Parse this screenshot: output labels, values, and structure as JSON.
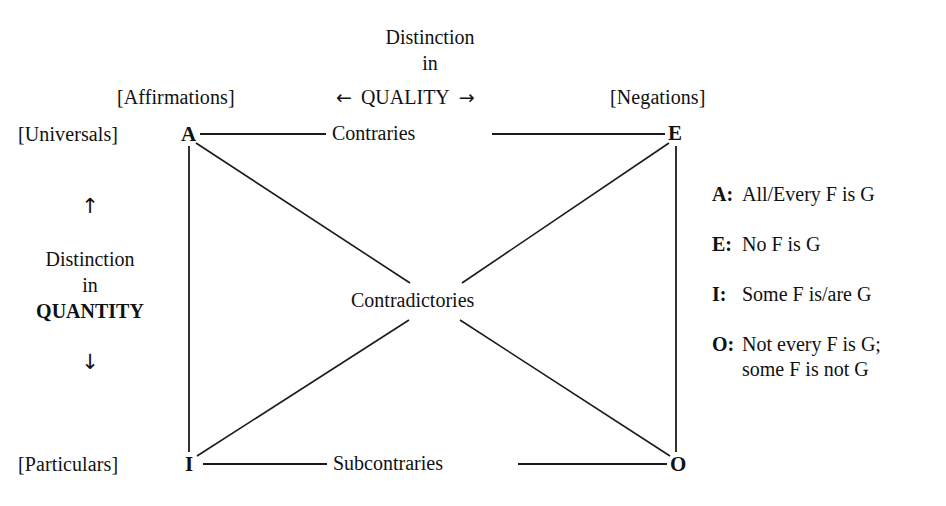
{
  "diagram": {
    "background_color": "#ffffff",
    "line_color": "#1a1a1a"
  },
  "quality_axis": {
    "line1": "Distinction",
    "line2": "in",
    "keyword": "QUALITY",
    "left_arrow": "←",
    "right_arrow": "→"
  },
  "quantity_axis": {
    "up_arrow": "↑",
    "line1": "Distinction",
    "line2": "in",
    "keyword": "QUANTITY",
    "down_arrow": "↓"
  },
  "column_labels": {
    "affirmations": "[Affirmations]",
    "negations": "[Negations]"
  },
  "row_labels": {
    "universals": "[Universals]",
    "particulars": "[Particulars]"
  },
  "vertices": {
    "a": "A",
    "e": "E",
    "i": "I",
    "o": "O"
  },
  "relations": {
    "top": "Contraries",
    "bottom": "Subcontraries",
    "center": "Contradictories"
  },
  "legend": [
    {
      "key": "A:",
      "text": "All/Every F is G"
    },
    {
      "key": "E:",
      "text": "No F is G"
    },
    {
      "key": "I:",
      "text": "Some F is/are G"
    },
    {
      "key": "O:",
      "text": "Not every F is G;\nsome F is not G"
    }
  ]
}
